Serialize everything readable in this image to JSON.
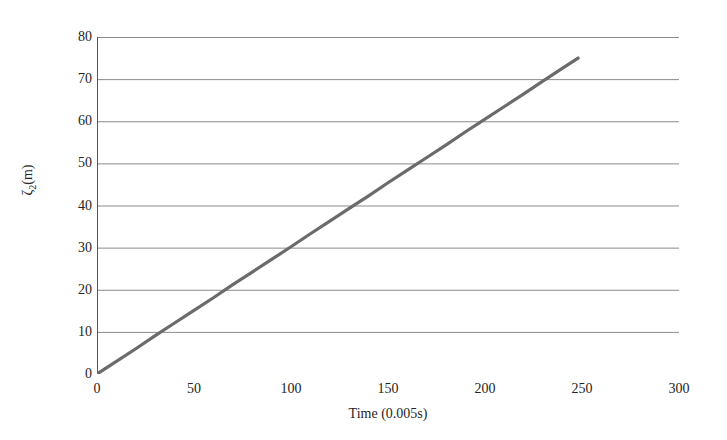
{
  "chart_data": {
    "type": "line",
    "title": "",
    "subtitle": "",
    "xlabel": "Time (0.005s)",
    "ylabel": "ζ₂(m)",
    "ylabel_base": "ζ",
    "ylabel_sub": "2",
    "ylabel_unit": "(m)",
    "xlim": [
      0,
      300
    ],
    "ylim": [
      0,
      80
    ],
    "xticks": [
      0,
      50,
      100,
      150,
      200,
      250,
      300
    ],
    "xtick_labels": [
      "0",
      "50",
      "100",
      "150",
      "200",
      "250",
      "300"
    ],
    "yticks": [
      0,
      10,
      20,
      30,
      40,
      50,
      60,
      70,
      80
    ],
    "ytick_labels": [
      "0",
      "10",
      "20",
      "30",
      "40",
      "50",
      "60",
      "70",
      "80"
    ],
    "grid": "horizontal",
    "legend": "none",
    "annotations": [],
    "line_color": "#6b6b6b",
    "grid_color": "#8a8a8a",
    "axis_color": "#555555",
    "background_color": "#ffffff",
    "series": [
      {
        "name": "zeta2",
        "color": "#6b6b6b",
        "x": [
          0,
          10,
          20,
          30,
          40,
          50,
          60,
          70,
          80,
          90,
          100,
          110,
          120,
          130,
          140,
          150,
          160,
          170,
          180,
          190,
          200,
          210,
          220,
          230,
          240,
          248
        ],
        "values": [
          0,
          3.0,
          6.0,
          9.1,
          12.1,
          15.1,
          18.1,
          21.2,
          24.2,
          27.2,
          30.2,
          33.3,
          36.3,
          39.3,
          42.3,
          45.4,
          48.4,
          51.4,
          54.4,
          57.5,
          60.5,
          63.5,
          66.5,
          69.6,
          72.6,
          75.0
        ]
      }
    ]
  }
}
